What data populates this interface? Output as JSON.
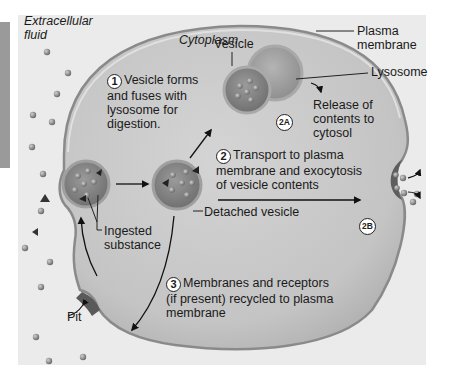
{
  "figure": {
    "topic": "Endocytosis and fate of vesicles",
    "regions": {
      "extracellular": "Extracellular\nfluid",
      "extracellular_line1": "Extracellular",
      "extracellular_line2": "fluid",
      "cytoplasm": "Cytoplasm"
    },
    "labels": {
      "plasma_membrane_1": "Plasma",
      "plasma_membrane_2": "membrane",
      "vesicle": "Vesicle",
      "lysosome": "Lysosome",
      "release_1": "Release of",
      "release_2": "contents to",
      "release_3": "cytosol",
      "detached_vesicle": "Detached vesicle",
      "ingested_1": "Ingested",
      "ingested_2": "substance",
      "pit": "Pit"
    },
    "steps": [
      {
        "number": "1",
        "lines": [
          "Vesicle forms",
          "and fuses with",
          "lysosome for",
          "digestion."
        ]
      },
      {
        "number": "2",
        "lines": [
          "Transport to plasma",
          "membrane and exocytosis",
          "of vesicle contents"
        ]
      },
      {
        "number": "3",
        "lines": [
          "Membranes and receptors",
          "(if present) recycled to plasma",
          "membrane"
        ]
      }
    ],
    "badges": {
      "a": "2A",
      "b": "2B"
    },
    "colors": {
      "cytoplasm": "#c9c9c9",
      "membrane": "#8a8a8a",
      "vesicle": "#8c8c8c",
      "lysosome": "#a5a5a5",
      "background": "#ececec",
      "side_strip": "#9a9a9a"
    }
  }
}
